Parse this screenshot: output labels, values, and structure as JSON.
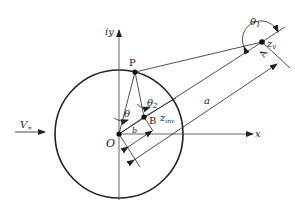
{
  "diagram": {
    "labels": {
      "iy": "iy",
      "x": "x",
      "P": "P",
      "O": "O",
      "theta": "θ",
      "theta1": "θ",
      "theta1_sub": "1",
      "theta2": "θ",
      "theta2_sub": "2",
      "zv": "z",
      "zv_sub": "v",
      "A": "A",
      "a": "a",
      "B": "B",
      "b": "b",
      "zinv": "z",
      "zinv_sub": "inv",
      "Vinf": "V",
      "Vinf_sub": "∞"
    },
    "colors": {
      "line": "#222222",
      "axis": "#555555",
      "background": "#ffffff"
    }
  }
}
